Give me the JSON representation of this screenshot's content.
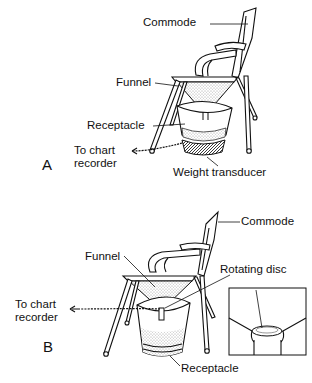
{
  "figure": {
    "panels": [
      {
        "letter": "A",
        "labels": {
          "commode": "Commode",
          "funnel": "Funnel",
          "receptacle": "Receptacle",
          "to_chart_line1": "To chart",
          "to_chart_line2": "recorder",
          "weight_transducer": "Weight transducer"
        }
      },
      {
        "letter": "B",
        "labels": {
          "commode": "Commode",
          "funnel": "Funnel",
          "rotating_disc": "Rotating disc",
          "to_chart_line1": "To chart",
          "to_chart_line2": "recorder",
          "receptacle": "Receptacle"
        },
        "inset": "rotating-disc-detail"
      }
    ]
  }
}
